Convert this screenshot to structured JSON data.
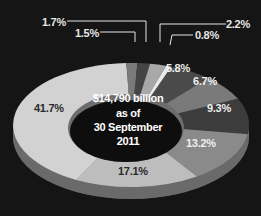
{
  "chart_data": {
    "type": "pie",
    "variant": "donut-3d",
    "title": "",
    "center_label": [
      "$14,790 billion",
      "as of",
      "30 September",
      "2011"
    ],
    "slices": [
      {
        "label": "0.8%",
        "value": 0.8,
        "color": "#e8e8e8",
        "label_pos": "outside"
      },
      {
        "label": "5.8%",
        "value": 5.8,
        "color": "#4a4a4a",
        "label_pos": "inside"
      },
      {
        "label": "6.7%",
        "value": 6.7,
        "color": "#7a7a7a",
        "label_pos": "inside"
      },
      {
        "label": "9.3%",
        "value": 9.3,
        "color": "#3c3c3c",
        "label_pos": "inside"
      },
      {
        "label": "13.2%",
        "value": 13.2,
        "color": "#8a8a8a",
        "label_pos": "inside"
      },
      {
        "label": "17.1%",
        "value": 17.1,
        "color": "#bdbdbd",
        "label_pos": "inside"
      },
      {
        "label": "41.7%",
        "value": 41.7,
        "color": "#d2d2d2",
        "label_pos": "inside"
      },
      {
        "label": "1.5%",
        "value": 1.5,
        "color": "#7a7a7a",
        "label_pos": "outside"
      },
      {
        "label": "1.7%",
        "value": 1.7,
        "color": "#444444",
        "label_pos": "outside"
      },
      {
        "label": "2.2%",
        "value": 2.2,
        "color": "#a8a8a8",
        "label_pos": "outside"
      }
    ],
    "legend": "none"
  },
  "labels": {
    "l08": "0.8%",
    "l58": "5.8%",
    "l67": "6.7%",
    "l93": "9.3%",
    "l132": "13.2%",
    "l171": "17.1%",
    "l417": "41.7%",
    "l15": "1.5%",
    "l17": "1.7%",
    "l22": "2.2%"
  },
  "center": {
    "line1": "$14,790 billion",
    "line2": "as of",
    "line3": "30 September",
    "line4": "2011"
  }
}
